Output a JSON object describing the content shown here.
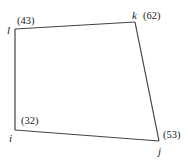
{
  "diagram": {
    "type": "quadrilateral-graph",
    "stroke_color": "#444444",
    "vertices": [
      {
        "id": "l",
        "name": "l",
        "weight": "(43)",
        "x": 15,
        "y": 29
      },
      {
        "id": "k",
        "name": "k",
        "weight": "(62)",
        "x": 135,
        "y": 22
      },
      {
        "id": "j",
        "name": "j",
        "weight": "(53)",
        "x": 159,
        "y": 141
      },
      {
        "id": "i",
        "name": "i",
        "weight": "(32)",
        "x": 15,
        "y": 130
      }
    ],
    "edges": [
      {
        "from": "l",
        "to": "k"
      },
      {
        "from": "k",
        "to": "j"
      },
      {
        "from": "j",
        "to": "i"
      },
      {
        "from": "i",
        "to": "l"
      }
    ]
  }
}
